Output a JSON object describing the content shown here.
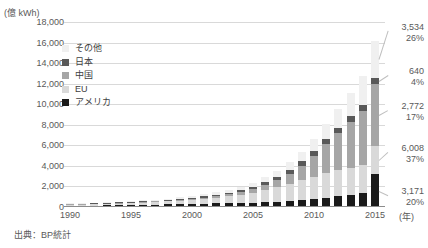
{
  "chart_data": {
    "type": "bar",
    "title": "",
    "subtitle": "",
    "unit_label": "(億 kWh)",
    "xlabel": "(年)",
    "ylabel": "",
    "ylim": [
      0,
      18000
    ],
    "ytick_step": 2000,
    "ytick_labels": [
      "18,000",
      "16,000",
      "14,000",
      "12,000",
      "10,000",
      "8,000",
      "6,000",
      "4,000",
      "2,000",
      "0"
    ],
    "xtick_labels": [
      "1990",
      "1995",
      "2000",
      "2005",
      "2010",
      "2015"
    ],
    "grid": true,
    "stacked": true,
    "legend_position": "inside-upper-left",
    "legend": [
      "その他",
      "日本",
      "中国",
      "EU",
      "アメリカ"
    ],
    "categories": [
      "1990",
      "1991",
      "1992",
      "1993",
      "1994",
      "1995",
      "1996",
      "1997",
      "1998",
      "1999",
      "2000",
      "2001",
      "2002",
      "2003",
      "2004",
      "2005",
      "2006",
      "2007",
      "2008",
      "2009",
      "2010",
      "2011",
      "2012",
      "2013",
      "2014",
      "2015"
    ],
    "series": [
      {
        "name": "アメリカ",
        "color": "#1a1a1a",
        "values": [
          170,
          180,
          185,
          190,
          200,
          210,
          225,
          240,
          255,
          275,
          300,
          320,
          345,
          370,
          400,
          430,
          470,
          530,
          600,
          690,
          790,
          900,
          1030,
          1180,
          1400,
          3171
        ]
      },
      {
        "name": "EU",
        "color": "#d9d9d9",
        "values": [
          110,
          120,
          135,
          150,
          170,
          195,
          225,
          260,
          300,
          350,
          410,
          480,
          570,
          680,
          810,
          970,
          1160,
          1380,
          1640,
          1900,
          2170,
          2400,
          2560,
          2660,
          2720,
          2772
        ]
      },
      {
        "name": "中国",
        "color": "#a6a6a6",
        "values": [
          20,
          22,
          25,
          28,
          32,
          36,
          42,
          50,
          60,
          72,
          88,
          110,
          140,
          180,
          240,
          330,
          470,
          690,
          1000,
          1450,
          2050,
          2800,
          3600,
          4400,
          5200,
          6008
        ]
      },
      {
        "name": "日本",
        "color": "#595959",
        "values": [
          25,
          28,
          32,
          36,
          40,
          46,
          54,
          64,
          76,
          90,
          108,
          128,
          152,
          180,
          212,
          248,
          288,
          330,
          380,
          420,
          460,
          500,
          540,
          580,
          610,
          640
        ]
      },
      {
        "name": "その他",
        "color": "#f0f0f0",
        "values": [
          40,
          45,
          50,
          58,
          66,
          76,
          88,
          102,
          120,
          140,
          165,
          195,
          230,
          275,
          330,
          400,
          490,
          600,
          740,
          920,
          1150,
          1450,
          1820,
          2280,
          2850,
          3534
        ]
      }
    ],
    "annotations": [
      {
        "label": "その他",
        "value": "3,534",
        "pct": "26%",
        "y": 22
      },
      {
        "label": "日本",
        "value": "640",
        "pct": "4%",
        "y": 66
      },
      {
        "label": "中国",
        "value": "2,772",
        "pct": "17%",
        "y": 101
      },
      {
        "label": "EU",
        "value": "6,008",
        "pct": "37%",
        "y": 143
      },
      {
        "label": "アメリカ",
        "value": "3,171",
        "pct": "20%",
        "y": 186
      }
    ],
    "source": "出典：BP統計"
  }
}
